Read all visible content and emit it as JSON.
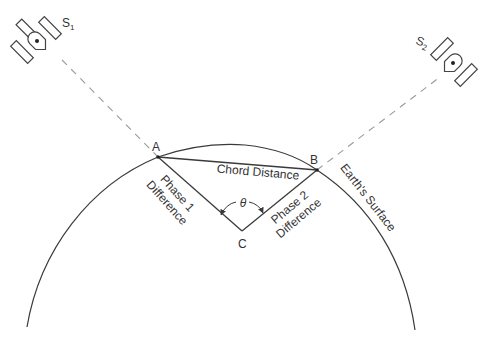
{
  "diagram": {
    "type": "geometry-illustration",
    "satellites": [
      {
        "id": "S1",
        "label": "S",
        "subscript": "1"
      },
      {
        "id": "S2",
        "label": "S",
        "subscript": "2"
      }
    ],
    "points": {
      "A": "A",
      "B": "B",
      "C": "C"
    },
    "labels": {
      "chord": "Chord Distance",
      "phase1_line1": "Phase 1",
      "phase1_line2": "Difference",
      "phase2_line1": "Phase 2",
      "phase2_line2": "Difference",
      "angle": "θ",
      "surface": "Earth's Surface"
    },
    "colors": {
      "line": "#3a3a3a",
      "dashed": "#9a9a9a",
      "text": "#333333",
      "background": "#ffffff"
    }
  }
}
